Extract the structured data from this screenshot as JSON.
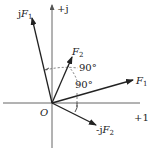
{
  "diagram": {
    "axes": {
      "imag_label": "+j",
      "real_label": "+1",
      "origin_label": "O"
    },
    "vectors": [
      {
        "name": "F1",
        "label_prefix": "",
        "label_main": "F",
        "label_sub": "1"
      },
      {
        "name": "F2",
        "label_prefix": "",
        "label_main": "F",
        "label_sub": "2"
      },
      {
        "name": "jF1",
        "label_prefix": "j",
        "label_main": "F",
        "label_sub": "1"
      },
      {
        "name": "-jF2",
        "label_prefix": "-j",
        "label_main": "F",
        "label_sub": "2"
      }
    ],
    "angles": [
      {
        "label": "90°"
      },
      {
        "label": "90°"
      }
    ],
    "colors": {
      "ink": "#222222",
      "axis": "#555555",
      "dashed": "#444444"
    }
  }
}
